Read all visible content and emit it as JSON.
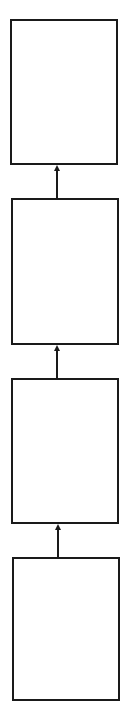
{
  "diagram": {
    "type": "vertical-flow",
    "direction": "bottom-to-top",
    "stroke_color": "#1a1a1a",
    "background_color": "#ffffff",
    "boxes": [
      {
        "id": "box-1",
        "label": "",
        "x": 10,
        "y": 19,
        "w": 108,
        "h": 146
      },
      {
        "id": "box-2",
        "label": "",
        "x": 11,
        "y": 198,
        "w": 108,
        "h": 147
      },
      {
        "id": "box-3",
        "label": "",
        "x": 11,
        "y": 378,
        "w": 108,
        "h": 146
      },
      {
        "id": "box-4",
        "label": "",
        "x": 12,
        "y": 557,
        "w": 108,
        "h": 144
      }
    ],
    "arrows": [
      {
        "from": "box-2",
        "to": "box-1",
        "x": 57,
        "y_top": 165,
        "y_bottom": 198
      },
      {
        "from": "box-3",
        "to": "box-2",
        "x": 57,
        "y_top": 345,
        "y_bottom": 378
      },
      {
        "from": "box-4",
        "to": "box-3",
        "x": 58,
        "y_top": 524,
        "y_bottom": 557
      }
    ]
  }
}
